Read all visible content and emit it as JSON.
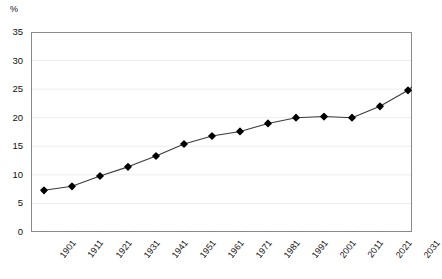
{
  "chart_data": {
    "type": "line",
    "title": "",
    "subtitle": "",
    "xlabel": "",
    "ylabel": "%",
    "ylim": [
      0,
      35
    ],
    "yticks": [
      0,
      5,
      10,
      15,
      20,
      25,
      30,
      35
    ],
    "grid": true,
    "legend": false,
    "legend_position": "none",
    "marker": "diamond",
    "line_color": "#333333",
    "marker_color": "#000000",
    "categories": [
      "1901",
      "1911",
      "1921",
      "1931",
      "1941",
      "1951",
      "1961",
      "1971",
      "1981",
      "1991",
      "2001",
      "2011",
      "2021",
      "2031",
      ""
    ],
    "xtick_labels": [
      "1901",
      "1911",
      "1921",
      "1931",
      "1941",
      "1951",
      "1961",
      "1971",
      "1981",
      "1991",
      "2001",
      "2011",
      "2021",
      "2031"
    ],
    "values": [
      7.3,
      8.0,
      9.8,
      11.4,
      13.3,
      15.4,
      16.8,
      17.6,
      19.0,
      20.0,
      20.2,
      20.0,
      22.0,
      24.8,
      29.0
    ],
    "series": [
      {
        "name": "",
        "values": [
          7.3,
          8.0,
          9.8,
          11.4,
          13.3,
          15.4,
          16.8,
          17.6,
          19.0,
          20.0,
          20.2,
          20.0,
          22.0,
          24.8,
          29.0
        ]
      }
    ],
    "annotations": []
  },
  "axis": {
    "unit_label": "%"
  }
}
